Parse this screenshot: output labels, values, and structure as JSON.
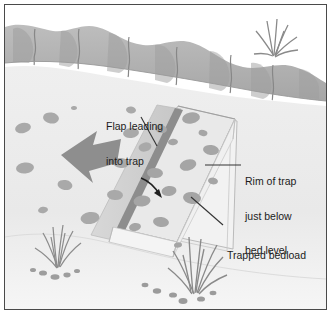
{
  "figure": {
    "type": "technical-illustration",
    "style": "grayscale line and tone drawing",
    "border_color": "#4a4a4a",
    "background_color": "#fdfdfd"
  },
  "labels": {
    "flap": {
      "line1": "Flap leading",
      "line2": "into trap"
    },
    "rim": {
      "line1": "Rim of trap",
      "line2": "just below",
      "line3": "bed level"
    },
    "bedload": {
      "line1": "Trapped bedload"
    }
  },
  "palette": {
    "bank_light": "#b9b9b9",
    "bank_dark": "#9b9b9b",
    "bank_crack": "#8a8a8a",
    "bed_light": "#ededed",
    "bed_shade": "#e3e3e3",
    "pebble": "#a9a9a9",
    "pebble_dark": "#9a9a9a",
    "flap_face": "#cfcfcf",
    "flap_edge": "#8d8d8d",
    "trap_inner": "#e8e8e8",
    "arrow_flow": "#8e8e8e",
    "arrow_small": "#222222",
    "grass": "#8f8f8f",
    "leader_line": "#3a3a3a",
    "text": "#1c1c1c"
  },
  "elements": {
    "bank": "eroded vertical bank across top, descending left to right",
    "flow_arrow": "large grey arrow pointing right indicating flow direction",
    "small_arrow": "small black curved arrow crossing flap into trap",
    "trap": "rectangular trap drawn in perspective, open top, rim at bed level",
    "flap": "inclined plate leading into trap, dark lower edge",
    "grass_tufts": 3,
    "pebble_count_bed": 14,
    "pebble_count_trap": 13
  }
}
